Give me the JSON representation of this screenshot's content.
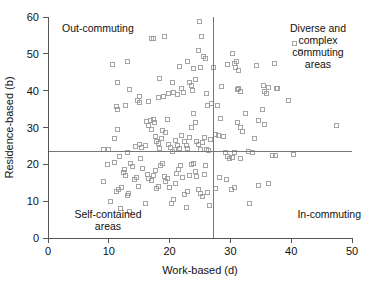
{
  "chart_data": {
    "type": "scatter",
    "title": "",
    "xlabel": "Work-based (d)",
    "ylabel": "Residence-based (b)",
    "xlim": [
      0,
      50
    ],
    "ylim": [
      0,
      60
    ],
    "xticks": [
      0,
      10,
      20,
      30,
      40,
      50
    ],
    "yticks": [
      0,
      10,
      20,
      30,
      40,
      50,
      60
    ],
    "grid": false,
    "legend": "none",
    "reference_lines": {
      "vertical_x": 27.2,
      "horizontal_y": 23.5,
      "color": "#777777"
    },
    "marker": {
      "shape": "open-square",
      "size_px": 4,
      "stroke": "#9a9a9a",
      "fill": "none"
    },
    "annotations": [
      {
        "id": "out-commuting",
        "text": "Out-commuting",
        "quadrant": "top-left"
      },
      {
        "id": "diverse-complex",
        "text": "Diverse and\ncomplex\ncommuting\nareas",
        "quadrant": "top-right"
      },
      {
        "id": "self-contained",
        "text": "Self-contained\nareas",
        "quadrant": "bottom-left"
      },
      {
        "id": "in-commuting",
        "text": "In-commuting",
        "quadrant": "bottom-right"
      }
    ],
    "points": [
      [
        10.6,
        47.0
      ],
      [
        11.4,
        42.3
      ],
      [
        13.0,
        47.9
      ],
      [
        13.4,
        40.3
      ],
      [
        11.2,
        35.6
      ],
      [
        11.4,
        34.9
      ],
      [
        12.8,
        36.1
      ],
      [
        14.8,
        37.3
      ],
      [
        15.0,
        36.8
      ],
      [
        15.1,
        38.3
      ],
      [
        16.6,
        37.0
      ],
      [
        17.1,
        54.1
      ],
      [
        17.3,
        54.2
      ],
      [
        19.1,
        54.7
      ],
      [
        18.4,
        43.4
      ],
      [
        18.2,
        38.2
      ],
      [
        19.0,
        38.4
      ],
      [
        19.8,
        39.2
      ],
      [
        20.5,
        42.2
      ],
      [
        20.7,
        39.4
      ],
      [
        21.3,
        39.0
      ],
      [
        22.0,
        40.5
      ],
      [
        22.3,
        39.6
      ],
      [
        21.7,
        46.6
      ],
      [
        23.0,
        47.8
      ],
      [
        23.3,
        42.3
      ],
      [
        23.6,
        41.4
      ],
      [
        23.7,
        40.1
      ],
      [
        24.3,
        42.9
      ],
      [
        24.0,
        46.0
      ],
      [
        24.7,
        50.8
      ],
      [
        24.9,
        58.9
      ],
      [
        25.3,
        54.8
      ],
      [
        25.6,
        49.4
      ],
      [
        25.9,
        48.8
      ],
      [
        25.0,
        46.2
      ],
      [
        26.0,
        39.1
      ],
      [
        26.3,
        36.0
      ],
      [
        26.9,
        36.4
      ],
      [
        27.3,
        46.4
      ],
      [
        27.9,
        35.9
      ],
      [
        28.6,
        41.0
      ],
      [
        29.6,
        47.1
      ],
      [
        30.3,
        50.1
      ],
      [
        30.6,
        47.3
      ],
      [
        30.9,
        46.2
      ],
      [
        31.3,
        45.6
      ],
      [
        31.0,
        48.0
      ],
      [
        31.4,
        40.7
      ],
      [
        31.2,
        40.2
      ],
      [
        31.6,
        39.9
      ],
      [
        34.3,
        46.7
      ],
      [
        35.4,
        41.4
      ],
      [
        35.6,
        39.8
      ],
      [
        35.9,
        39.3
      ],
      [
        36.3,
        40.9
      ],
      [
        37.3,
        47.4
      ],
      [
        37.5,
        40.7
      ],
      [
        37.8,
        40.5
      ],
      [
        39.5,
        37.3
      ],
      [
        40.6,
        52.7
      ],
      [
        41.6,
        50.5
      ],
      [
        9.1,
        24.0
      ],
      [
        10.0,
        23.9
      ],
      [
        11.0,
        27.1
      ],
      [
        11.4,
        29.5
      ],
      [
        11.8,
        22.0
      ],
      [
        13.0,
        23.3
      ],
      [
        14.4,
        24.9
      ],
      [
        15.1,
        25.3
      ],
      [
        15.4,
        24.6
      ],
      [
        16.0,
        25.1
      ],
      [
        16.2,
        31.6
      ],
      [
        16.5,
        30.6
      ],
      [
        16.8,
        32.0
      ],
      [
        17.0,
        29.5
      ],
      [
        17.3,
        32.2
      ],
      [
        17.5,
        31.3
      ],
      [
        17.7,
        27.6
      ],
      [
        17.9,
        26.2
      ],
      [
        18.2,
        25.6
      ],
      [
        18.4,
        24.3
      ],
      [
        18.6,
        27.1
      ],
      [
        18.9,
        29.1
      ],
      [
        19.3,
        28.6
      ],
      [
        19.6,
        32.2
      ],
      [
        19.9,
        25.4
      ],
      [
        20.1,
        24.7
      ],
      [
        20.4,
        23.6
      ],
      [
        20.8,
        24.0
      ],
      [
        21.0,
        26.5
      ],
      [
        21.3,
        25.2
      ],
      [
        21.6,
        24.4
      ],
      [
        22.0,
        27.7
      ],
      [
        22.4,
        26.1
      ],
      [
        22.7,
        25.0
      ],
      [
        23.0,
        24.2
      ],
      [
        23.3,
        27.4
      ],
      [
        23.6,
        30.0
      ],
      [
        23.9,
        33.9
      ],
      [
        24.2,
        31.4
      ],
      [
        24.5,
        26.3
      ],
      [
        24.8,
        25.4
      ],
      [
        25.1,
        24.0
      ],
      [
        25.4,
        25.8
      ],
      [
        25.8,
        27.2
      ],
      [
        26.0,
        24.1
      ],
      [
        26.4,
        23.8
      ],
      [
        26.8,
        26.7
      ],
      [
        27.6,
        28.1
      ],
      [
        28.0,
        27.9
      ],
      [
        28.4,
        32.5
      ],
      [
        28.8,
        27.6
      ],
      [
        29.2,
        23.3
      ],
      [
        29.5,
        22.1
      ],
      [
        29.9,
        21.5
      ],
      [
        30.3,
        21.8
      ],
      [
        30.7,
        23.2
      ],
      [
        31.2,
        31.4
      ],
      [
        31.6,
        29.9
      ],
      [
        32.0,
        28.9
      ],
      [
        32.5,
        33.7
      ],
      [
        33.0,
        23.5
      ],
      [
        33.6,
        23.3
      ],
      [
        34.0,
        26.9
      ],
      [
        34.6,
        31.8
      ],
      [
        35.2,
        35.0
      ],
      [
        35.6,
        30.7
      ],
      [
        37.0,
        22.4
      ],
      [
        37.4,
        22.3
      ],
      [
        40.4,
        22.8
      ],
      [
        47.4,
        30.5
      ],
      [
        9.2,
        15.4
      ],
      [
        9.8,
        19.9
      ],
      [
        10.3,
        9.8
      ],
      [
        11.0,
        20.5
      ],
      [
        11.3,
        12.6
      ],
      [
        11.6,
        13.2
      ],
      [
        11.9,
        8.0
      ],
      [
        12.1,
        13.8
      ],
      [
        12.4,
        17.8
      ],
      [
        12.6,
        18.7
      ],
      [
        12.8,
        17.0
      ],
      [
        13.0,
        11.6
      ],
      [
        13.2,
        12.2
      ],
      [
        13.4,
        7.3
      ],
      [
        13.6,
        20.2
      ],
      [
        13.9,
        19.4
      ],
      [
        14.2,
        15.8
      ],
      [
        14.6,
        16.4
      ],
      [
        14.9,
        13.9
      ],
      [
        15.2,
        21.5
      ],
      [
        15.6,
        18.9
      ],
      [
        16.0,
        9.5
      ],
      [
        16.3,
        17.2
      ],
      [
        16.6,
        16.1
      ],
      [
        17.0,
        15.6
      ],
      [
        17.3,
        16.9
      ],
      [
        17.6,
        18.2
      ],
      [
        17.9,
        13.5
      ],
      [
        18.2,
        14.1
      ],
      [
        18.5,
        19.6
      ],
      [
        18.8,
        20.2
      ],
      [
        19.1,
        16.7
      ],
      [
        19.4,
        15.3
      ],
      [
        19.7,
        16.2
      ],
      [
        20.0,
        13.7
      ],
      [
        20.3,
        9.4
      ],
      [
        20.6,
        10.4
      ],
      [
        20.9,
        14.8
      ],
      [
        21.2,
        17.4
      ],
      [
        21.5,
        18.5
      ],
      [
        21.8,
        19.8
      ],
      [
        22.1,
        16.3
      ],
      [
        22.4,
        11.9
      ],
      [
        22.7,
        8.3
      ],
      [
        23.0,
        12.7
      ],
      [
        23.3,
        17.1
      ],
      [
        23.6,
        19.9
      ],
      [
        23.9,
        20.1
      ],
      [
        24.2,
        18.0
      ],
      [
        24.5,
        16.8
      ],
      [
        24.8,
        13.2
      ],
      [
        25.1,
        12.1
      ],
      [
        25.4,
        11.4
      ],
      [
        25.7,
        17.2
      ],
      [
        25.9,
        19.7
      ],
      [
        26.2,
        12.4
      ],
      [
        26.5,
        8.7
      ],
      [
        27.5,
        13.4
      ],
      [
        28.2,
        16.5
      ],
      [
        29.3,
        15.8
      ],
      [
        30.1,
        13.3
      ],
      [
        30.6,
        13.6
      ],
      [
        31.6,
        21.7
      ],
      [
        33.2,
        9.5
      ],
      [
        34.6,
        14.2
      ],
      [
        36.2,
        14.9
      ]
    ]
  }
}
